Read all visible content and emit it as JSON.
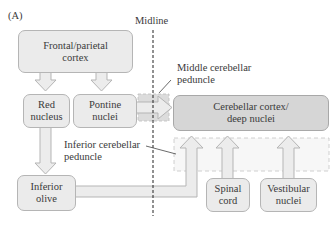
{
  "figure": {
    "panel_label": "(A)",
    "midline_label": "Midline",
    "colors": {
      "box_fill": "#ebebeb",
      "box_fill_dark": "#d6d6d6",
      "box_border": "#b5b5b5",
      "arrow_fill": "#ececec",
      "peduncle_fill": "#dcdcdc",
      "midline": "#222222"
    }
  },
  "nodes": {
    "frontal_parietal_cortex": "Frontal/parietal\ncortex",
    "red_nucleus": "Red\nnucleus",
    "pontine_nuclei": "Pontine\nnuclei",
    "cerebellar_cortex": "Cerebellar cortex/\ndeep nuclei",
    "inferior_olive": "Inferior\nolive",
    "spinal_cord": "Spinal\ncord",
    "vestibular_nuclei": "Vestibular\nnuclei"
  },
  "annotations": {
    "middle_peduncle": "Middle cerebellar\npeduncle",
    "inferior_peduncle": "Inferior cerebellar\npeduncle"
  },
  "connections": [
    {
      "from": "Frontal/parietal cortex",
      "to": "Red nucleus"
    },
    {
      "from": "Frontal/parietal cortex",
      "to": "Pontine nuclei"
    },
    {
      "from": "Pontine nuclei",
      "to": "Cerebellar cortex/deep nuclei",
      "via": "Middle cerebellar peduncle"
    },
    {
      "from": "Red nucleus",
      "to": "Inferior olive"
    },
    {
      "from": "Inferior olive",
      "to": "Cerebellar cortex/deep nuclei",
      "via": "Inferior cerebellar peduncle"
    },
    {
      "from": "Spinal cord",
      "to": "Cerebellar cortex/deep nuclei",
      "via": "Inferior cerebellar peduncle"
    },
    {
      "from": "Vestibular nuclei",
      "to": "Cerebellar cortex/deep nuclei",
      "via": "Inferior cerebellar peduncle"
    }
  ]
}
